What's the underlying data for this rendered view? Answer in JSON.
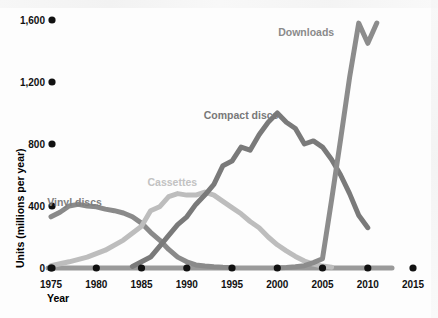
{
  "chart_data": {
    "type": "line",
    "title": "",
    "xlabel": "Year",
    "ylabel": "Units (millions per year)",
    "xlim": [
      1975,
      2015
    ],
    "ylim": [
      0,
      1600
    ],
    "grid": false,
    "legend": "inline-labels",
    "x_ticks": [
      "1975",
      "1980",
      "1985",
      "1990",
      "1995",
      "2000",
      "2005",
      "2010",
      "2015"
    ],
    "x_tick_values": [
      1975,
      1980,
      1985,
      1990,
      1995,
      2000,
      2005,
      2010,
      2015
    ],
    "y_ticks": [
      "0",
      "400",
      "800",
      "1,200",
      "1,600"
    ],
    "y_tick_values": [
      0,
      400,
      800,
      1200,
      1600
    ],
    "series": [
      {
        "name": "Vinyl discs",
        "color": "#8a8a8a",
        "label_x": 1977.6,
        "label_y": 400,
        "x": [
          1975,
          1976,
          1977,
          1978,
          1979,
          1980,
          1981,
          1982,
          1983,
          1984,
          1985,
          1986,
          1987,
          1988,
          1989,
          1990,
          1991,
          1992,
          1993,
          1994,
          1995
        ],
        "values": [
          330,
          360,
          400,
          410,
          400,
          395,
          380,
          370,
          355,
          330,
          290,
          230,
          180,
          120,
          70,
          40,
          20,
          12,
          8,
          5,
          4
        ]
      },
      {
        "name": "Cassettes",
        "color": "#bdbdbd",
        "label_x": 1988.4,
        "label_y": 530,
        "x": [
          1975,
          1977,
          1979,
          1981,
          1983,
          1985,
          1986,
          1987,
          1988,
          1989,
          1990,
          1991,
          1992,
          1993,
          1994,
          1995,
          1996,
          1997,
          1998,
          1999,
          2000,
          2001,
          2002,
          2003,
          2004,
          2005,
          2006
        ],
        "values": [
          15,
          40,
          70,
          115,
          180,
          270,
          370,
          395,
          460,
          480,
          470,
          470,
          490,
          470,
          430,
          390,
          350,
          300,
          260,
          200,
          150,
          110,
          75,
          45,
          25,
          12,
          5
        ]
      },
      {
        "name": "Compact discs",
        "color": "#7a7a7a",
        "label_x": 1996.0,
        "label_y": 960,
        "x": [
          1984,
          1986,
          1987,
          1988,
          1989,
          1990,
          1991,
          1992,
          1993,
          1994,
          1995,
          1996,
          1997,
          1998,
          1999,
          2000,
          2001,
          2002,
          2003,
          2004,
          2005,
          2006,
          2007,
          2008,
          2009,
          2010
        ],
        "values": [
          10,
          70,
          140,
          210,
          280,
          330,
          410,
          470,
          540,
          660,
          690,
          780,
          760,
          860,
          940,
          1000,
          940,
          900,
          800,
          820,
          780,
          700,
          600,
          480,
          340,
          260
        ]
      },
      {
        "name": "Downloads",
        "color": "#8c8c8c",
        "label_x": 2003.2,
        "label_y": 1500,
        "x": [
          2000,
          2001,
          2002,
          2003,
          2004,
          2005,
          2006,
          2007,
          2008,
          2009,
          2010
        ],
        "values": [
          2,
          4,
          8,
          15,
          35,
          60,
          440,
          830,
          1230,
          1580,
          1450
        ],
        "tail_x": [
          2010,
          2011
        ],
        "tail_values": [
          1450,
          1580
        ]
      }
    ],
    "annotations": [
      {
        "text": "Vinyl discs",
        "color": "#7f7f7f"
      },
      {
        "text": "Cassettes",
        "color": "#c2c2c2"
      },
      {
        "text": "Compact discs",
        "color": "#787878"
      },
      {
        "text": "Downloads",
        "color": "#8a8a8a"
      }
    ]
  },
  "axes": {
    "y_axis_title": "Units (millions per year)",
    "x_axis_title": "Year",
    "baseline_color": "#9a9a9a",
    "tick_dot_color": "#111111"
  }
}
